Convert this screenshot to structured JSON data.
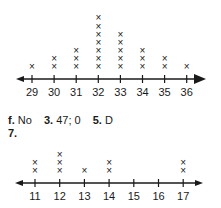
{
  "chart_data": [
    {
      "type": "dot-plot",
      "title": "",
      "categories": [
        "29",
        "30",
        "31",
        "32",
        "33",
        "34",
        "35",
        "36"
      ],
      "values": [
        1,
        2,
        3,
        7,
        5,
        3,
        2,
        1
      ],
      "marker": "x",
      "xlabel": "",
      "ylabel": "",
      "axis": {
        "arrows": "both"
      }
    },
    {
      "type": "dot-plot",
      "title": "7.",
      "categories": [
        "11",
        "12",
        "13",
        "14",
        "15",
        "16",
        "17"
      ],
      "values": [
        2,
        3,
        1,
        2,
        0,
        0,
        2
      ],
      "marker": "x",
      "xlabel": "",
      "ylabel": "",
      "axis": {
        "arrows": "both"
      }
    }
  ],
  "answers": [
    {
      "num": "f.",
      "text": "No"
    },
    {
      "num": "3.",
      "text": "47; 0"
    },
    {
      "num": "5.",
      "text": "D"
    }
  ],
  "question7_label": "7.",
  "colors": {
    "ink": "#1a1a1a",
    "background": "#ffffff"
  }
}
